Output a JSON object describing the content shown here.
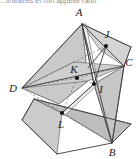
{
  "page": {
    "cut_heading": "...linéaires et l'on appelle raun",
    "background_color": "#ffffff"
  },
  "figure": {
    "caption_visible": false,
    "stroke_color": "#3d3d3d",
    "dashed_color": "#6e6e6e",
    "point_color": "#1a1a1a",
    "fill_light": "#d6d6d6",
    "fill_mid": "#c2c2c2",
    "fill_dark": "#aeaeae",
    "fill_darker": "#9c9c9c",
    "vertices": [
      {
        "name": "A",
        "label": "A",
        "x": 82,
        "y": 24,
        "label_x": 79,
        "label_y": 16
      },
      {
        "name": "B",
        "label": "B",
        "x": 112,
        "y": 143,
        "label_x": 112,
        "label_y": 155
      },
      {
        "name": "C",
        "label": "C",
        "x": 124,
        "y": 66,
        "label_x": 127,
        "label_y": 63
      },
      {
        "name": "D",
        "label": "D",
        "x": 22,
        "y": 88,
        "label_x": 12,
        "label_y": 92
      },
      {
        "name": "I",
        "label": "I",
        "x": 94,
        "y": 84,
        "label_x": 99,
        "label_y": 90
      },
      {
        "name": "J",
        "label": "J",
        "x": 106,
        "y": 46,
        "label_x": 106,
        "label_y": 39
      },
      {
        "name": "K",
        "label": "K",
        "x": 77,
        "y": 78,
        "label_x": 73,
        "label_y": 72
      },
      {
        "name": "L",
        "label": "L",
        "x": 62,
        "y": 113,
        "label_x": 60,
        "label_y": 126
      }
    ],
    "marked_points": [
      "I",
      "J",
      "K",
      "L"
    ],
    "solid_edges": [
      [
        "A",
        "B"
      ],
      [
        "A",
        "C"
      ],
      [
        "A",
        "D"
      ],
      [
        "B",
        "C"
      ],
      [
        "C",
        "D"
      ]
    ],
    "dashed_edges": [
      [
        "B",
        "D"
      ],
      [
        "D",
        "K"
      ],
      [
        "K",
        "I"
      ],
      [
        "D",
        "J"
      ],
      [
        "K",
        "L"
      ]
    ]
  }
}
